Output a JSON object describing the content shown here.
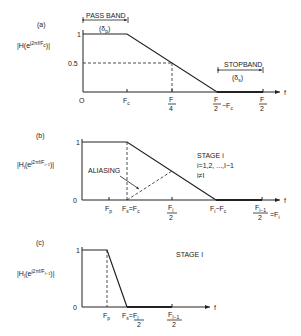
{
  "panels": {
    "a": {
      "label": "(a)",
      "ylabel_main": "|H(e",
      "ylabel_sup": "j2πf/F",
      "ylabel_end": ")|",
      "yticks": [
        "1",
        "0.5"
      ],
      "origin": "O",
      "xticks": {
        "fc": "F",
        "fc_sub": "c",
        "f4_num": "F",
        "f4_den": "4",
        "f2fc_num": "F",
        "f2fc_den": "2",
        "f2fc_rest": "−F",
        "f2fc_sub": "c",
        "f2_num": "F",
        "f2_den": "2"
      },
      "xaxis": "f",
      "passband_label": "PASS BAND",
      "passband_delta": "(δ",
      "passband_delta_sub": "p",
      "passband_close": ")",
      "stopband_label": "STOPBAND",
      "stopband_delta": "(δ",
      "stopband_delta_sub": "s",
      "stopband_close": ")"
    },
    "b": {
      "label": "(b)",
      "ylabel_main": "|H",
      "ylabel_sub": "i",
      "ylabel_mid": "(e",
      "ylabel_sup": "j2πf/F",
      "ylabel_sup_sub": "i−1",
      "ylabel_end": ")|",
      "yticks": [
        "1",
        "0"
      ],
      "xticks": {
        "fp": "F",
        "fp_sub": "p",
        "fsfc": "F",
        "fsfc_sub1": "s",
        "fsfc_mid": "=F",
        "fsfc_sub2": "c",
        "fi2_num": "F",
        "fi2_sub": "i",
        "fi2_den": "2",
        "fifc": "F",
        "fifc_sub1": "i",
        "fifc_mid": "−F",
        "fifc_sub2": "c",
        "fi1_num": "F",
        "fi1_sub": "i−1",
        "fi1_den": "2",
        "fi1_eq": "=F",
        "fi1_eq_sub": "i"
      },
      "xaxis": "f",
      "aliasing_label": "ALIASING",
      "stage_line1": "STAGE  i",
      "stage_line2": "i=1,2, ...,I−1",
      "stage_line3": "i≠I"
    },
    "c": {
      "label": "(c)",
      "ylabel_main": "|H",
      "ylabel_sub": "I",
      "ylabel_mid": "(e",
      "ylabel_sup": "j2πf/F",
      "ylabel_sup_sub": "I−1",
      "ylabel_end": ")|",
      "yticks": [
        "1",
        "0"
      ],
      "xticks": {
        "fp": "F",
        "fp_sub": "p",
        "fs": "F",
        "fs_sub": "s",
        "fs_eq": "=",
        "fs_num": "F",
        "fs_num_sub": "I",
        "fs_den": "2",
        "fi1_num": "F",
        "fi1_sub": "I−1",
        "fi1_den": "2"
      },
      "xaxis": "f",
      "stage_label": "STAGE  I"
    }
  }
}
